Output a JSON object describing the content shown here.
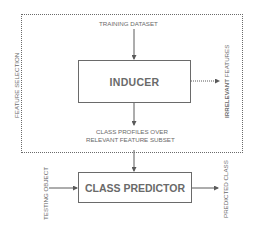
{
  "diagram": {
    "container_label": "FEATURE SELECTION",
    "input_label": "TRAINING DATASET",
    "inducer_label": "INDUCER",
    "side_output_label_bold": "IRRELEVANT",
    "side_output_label_rest": " FEATURES",
    "profiles_line1": "CLASS PROFILES OVER",
    "profiles_line2": "RELEVANT FEATURE SUBSET",
    "predictor_label": "CLASS PREDICTOR",
    "testing_label": "TESTING OBJECT",
    "output_label": "PREDICTED CLASS"
  },
  "colors": {
    "stroke": "#6a6a6a",
    "text": "#6a6a6a",
    "background": "#ffffff"
  }
}
